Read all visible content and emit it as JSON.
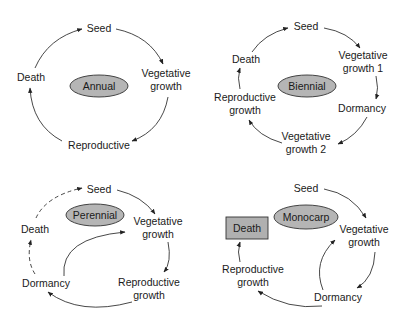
{
  "diagrams": [
    {
      "title": "Annual",
      "nodes": {
        "seed": "Seed",
        "veg": [
          "Vegetative",
          "growth"
        ],
        "repro": "Reproductive",
        "death": "Death"
      }
    },
    {
      "title": "Biennial",
      "nodes": {
        "seed": "Seed",
        "veg1": [
          "Vegetative",
          "growth 1"
        ],
        "dormancy": "Dormancy",
        "veg2": [
          "Vegetative",
          "growth 2"
        ],
        "repro": [
          "Reproductive",
          "growth"
        ],
        "death": "Death"
      }
    },
    {
      "title": "Perennial",
      "nodes": {
        "seed": "Seed",
        "veg": [
          "Vegetative",
          "growth"
        ],
        "repro": [
          "Reproductive",
          "growth"
        ],
        "dormancy": "Dormancy",
        "death": "Death"
      }
    },
    {
      "title": "Monocarp",
      "nodes": {
        "seed": "Seed",
        "veg": [
          "Vegetative",
          "growth"
        ],
        "dormancy": "Dormancy",
        "repro": [
          "Reproductive",
          "growth"
        ],
        "death": "Death"
      }
    }
  ],
  "colors": {
    "ellipse_fill": "#b5b5b5",
    "box_fill": "#b0b0b0",
    "stroke": "#333333"
  }
}
